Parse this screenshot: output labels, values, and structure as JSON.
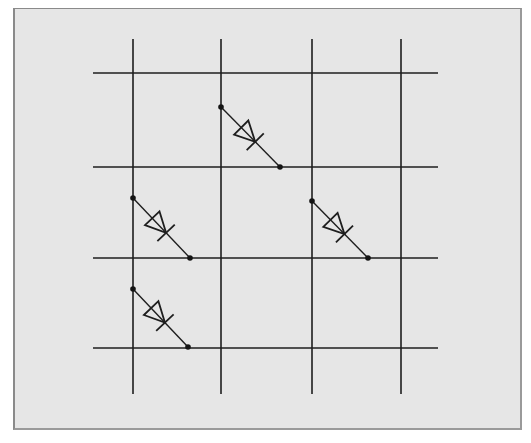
{
  "diagram": {
    "title": "",
    "colors": {
      "background": "#e6e6e6",
      "frame_border": "#8a8a8a",
      "line": "#1e1e1e"
    },
    "frame": {
      "x": 13,
      "y": 8,
      "width": 509,
      "height": 422
    },
    "columns": [
      {
        "id": "col-1",
        "x": 133,
        "y1": 39,
        "y2": 394
      },
      {
        "id": "col-2",
        "x": 221,
        "y1": 39,
        "y2": 394
      },
      {
        "id": "col-3",
        "x": 312,
        "y1": 39,
        "y2": 394
      },
      {
        "id": "col-4",
        "x": 401,
        "y1": 39,
        "y2": 394
      }
    ],
    "rows": [
      {
        "id": "row-1",
        "y": 73,
        "x1": 93,
        "x2": 438
      },
      {
        "id": "row-2",
        "y": 167,
        "x1": 93,
        "x2": 438
      },
      {
        "id": "row-3",
        "y": 258,
        "x1": 93,
        "x2": 438
      },
      {
        "id": "row-4",
        "y": 348,
        "x1": 93,
        "x2": 438
      }
    ],
    "diodes": [
      {
        "id": "diode-1",
        "from_column": "col-2",
        "to_row": "row-2",
        "start": [
          221,
          107
        ],
        "end": [
          280,
          167
        ]
      },
      {
        "id": "diode-2",
        "from_column": "col-1",
        "to_row": "row-3",
        "start": [
          133,
          198
        ],
        "end": [
          190,
          258
        ]
      },
      {
        "id": "diode-3",
        "from_column": "col-3",
        "to_row": "row-3",
        "start": [
          312,
          201
        ],
        "end": [
          368,
          258
        ]
      },
      {
        "id": "diode-4",
        "from_column": "col-1",
        "to_row": "row-4",
        "start": [
          133,
          289
        ],
        "end": [
          188,
          347
        ]
      }
    ]
  }
}
